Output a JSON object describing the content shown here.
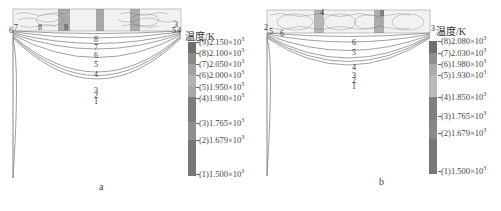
{
  "figure": {
    "panels": [
      {
        "id": "a",
        "caption": "a",
        "legend_title": "温度/K",
        "colorbar": [
          {
            "label": "(9)2.150×10",
            "exp": "3",
            "color": "#6e6e6e"
          },
          {
            "label": "(8)2.100×10",
            "exp": "3",
            "color": "#8a8a8a"
          },
          {
            "label": "(7)2.050×10",
            "exp": "3",
            "color": "#a2a2a2"
          },
          {
            "label": "(6)2.000×10",
            "exp": "3",
            "color": "#b3b3b3"
          },
          {
            "label": "(5)1.950×10",
            "exp": "3",
            "color": "#a8a8a8"
          },
          {
            "label": "(4)1.900×10",
            "exp": "3",
            "color": "#7c7c7c"
          },
          {
            "label": "(3)1.765×10",
            "exp": "3",
            "color": "#8e8e8e"
          },
          {
            "label": "(2)1.679×10",
            "exp": "3",
            "color": "#7a7a7a"
          },
          {
            "label": "(1)1.500×10",
            "exp": "3",
            "color": "#737373"
          }
        ],
        "contour_labels": [
          "8",
          "7",
          "6",
          "5",
          "4",
          "3",
          "2",
          "1"
        ],
        "edge_labels_left": [
          "6",
          "7"
        ],
        "edge_labels_top": [
          "8",
          "8"
        ],
        "edge_labels_right": [
          "5",
          "4",
          "3"
        ]
      },
      {
        "id": "b",
        "caption": "b",
        "legend_title": "温度/K",
        "colorbar": [
          {
            "label": "(8)2.080×10",
            "exp": "3",
            "color": "#6e6e6e"
          },
          {
            "label": "(7)2.030×10",
            "exp": "3",
            "color": "#909090"
          },
          {
            "label": "(6)1.980×10",
            "exp": "3",
            "color": "#ababab"
          },
          {
            "label": "(5)1.930×10",
            "exp": "3",
            "color": "#b8b8b8"
          },
          {
            "label": "(4)1.850×10",
            "exp": "3",
            "color": "#7e7e7e"
          },
          {
            "label": "(3)1.765×10",
            "exp": "3",
            "color": "#888888"
          },
          {
            "label": "(2)1.679×10",
            "exp": "3",
            "color": "#7a7a7a"
          },
          {
            "label": "(1)1.500×10",
            "exp": "3",
            "color": "#737373"
          }
        ],
        "contour_labels": [
          "6",
          "5",
          "4",
          "3",
          "2",
          "1"
        ],
        "edge_labels_left": [
          "2",
          "5",
          "6"
        ],
        "edge_labels_top": [
          "4",
          "8"
        ],
        "edge_labels_right": [
          "3"
        ]
      }
    ]
  }
}
